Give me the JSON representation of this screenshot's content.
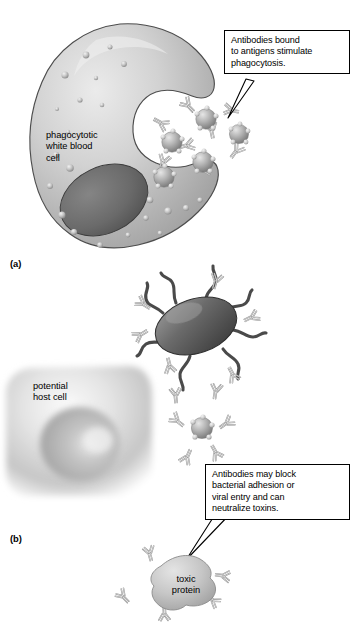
{
  "figure": {
    "background": "#ffffff",
    "width": 356,
    "height": 623
  },
  "colors": {
    "cytoplasm_light": "#dcdcdc",
    "cytoplasm_mid": "#c2c2c2",
    "cytoplasm_dark": "#9a9a9a",
    "nucleus_dark": "#6d6d6d",
    "nucleus_darker": "#585858",
    "granule": "#b8b8b8",
    "antigen_sphere": "#b0b0b0",
    "antibody_stroke": "#8c8c8c",
    "antibody_fill": "#e8e8e8",
    "bacterium_dark": "#595959",
    "bacterium_light": "#8a8a8a",
    "toxin_blob": "#c9c9c9",
    "outline": "#000000",
    "text": "#000000"
  },
  "panels": [
    {
      "id": "a",
      "label": "(a)",
      "cell_label": [
        "phagocytotic",
        "white blood",
        "cell"
      ],
      "callout": {
        "lines": [
          "Antibodies bound",
          "to antigens stimulate",
          "phagocytosis."
        ]
      }
    },
    {
      "id": "b",
      "label": "(b)",
      "cell_label": [
        "potential",
        "host cell"
      ],
      "toxin_label": [
        "toxic",
        "protein"
      ],
      "callout": {
        "lines": [
          "Antibodies may block",
          "bacterial adhesion or",
          "viral entry and can",
          "neutralize toxins."
        ]
      }
    }
  ],
  "structures": {
    "phagocyte_name": "phagocytic white blood cell",
    "antigen_name": "antigen particle",
    "antibody_name": "antibody",
    "bacterium_name": "bacterium",
    "host_cell_name": "potential host cell",
    "toxin_name": "toxic protein"
  }
}
